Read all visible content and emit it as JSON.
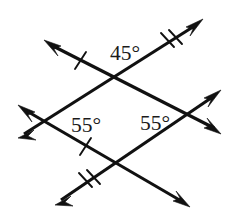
{
  "figure": {
    "type": "geometry-diagram",
    "background_color": "#ffffff",
    "line_color": "#111111",
    "label_color": "#1a1a1a"
  },
  "angle_labels": [
    {
      "id": "top",
      "text": "45°",
      "x": 125,
      "y": 55,
      "anchor": "middle"
    },
    {
      "id": "left",
      "text": "55°",
      "x": 86,
      "y": 127,
      "anchor": "middle"
    },
    {
      "id": "right",
      "text": "55°",
      "x": 155,
      "y": 125,
      "anchor": "middle"
    }
  ],
  "intersections": [
    {
      "id": "top",
      "x": 117,
      "y": 85
    },
    {
      "id": "left",
      "x": 50,
      "y": 120
    },
    {
      "id": "right",
      "x": 181,
      "y": 114
    },
    {
      "id": "bottom",
      "x": 116,
      "y": 160
    }
  ],
  "lines": [
    {
      "id": "line-upper-rising",
      "description": "rising line through left and top intersections, double tick",
      "from": {
        "x": 20,
        "y": 136
      },
      "to": {
        "x": 201,
        "y": 21
      },
      "tick_count": 2,
      "tick_at": {
        "x": 168,
        "y": 42
      },
      "arrow_start": true,
      "arrow_end": true
    },
    {
      "id": "line-lower-rising",
      "description": "rising line through bottom and right intersections, double tick",
      "from": {
        "x": 57,
        "y": 203
      },
      "to": {
        "x": 219,
        "y": 92
      },
      "tick_count": 2,
      "tick_at": {
        "x": 86,
        "y": 183
      },
      "arrow_start": true,
      "arrow_end": true
    },
    {
      "id": "line-upper-falling",
      "description": "falling line through top and right intersections, single tick",
      "from": {
        "x": 46,
        "y": 42
      },
      "to": {
        "x": 219,
        "y": 131
      },
      "tick_count": 1,
      "tick_at": {
        "x": 80,
        "y": 59
      },
      "arrow_start": true,
      "arrow_end": true
    },
    {
      "id": "line-lower-falling",
      "description": "falling line through left and bottom intersections, single tick",
      "from": {
        "x": 20,
        "y": 107
      },
      "to": {
        "x": 188,
        "y": 205
      },
      "tick_count": 1,
      "tick_at": {
        "x": 85,
        "y": 145
      },
      "arrow_start": true,
      "arrow_end": true
    }
  ]
}
